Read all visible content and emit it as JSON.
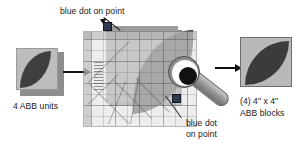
{
  "diagram": {
    "steps": [
      {
        "id": "step-input",
        "label": "4 ABB units"
      },
      {
        "id": "step-cut",
        "label": ""
      },
      {
        "id": "step-output",
        "label_line1": "(4) 4\" x 4\"",
        "label_line2": "ABB blocks"
      }
    ],
    "callouts": [
      {
        "id": "callout-top",
        "text": "blue dot on point"
      },
      {
        "id": "callout-bottom",
        "line1": "blue dot",
        "line2": "on point"
      }
    ],
    "icons": {
      "arrow_left_to_center": "arrow-right-icon",
      "arrow_center_to_right": "arrow-right-icon",
      "cutter": "rotary-cutter-icon",
      "ruler": "quilting-ruler-icon",
      "dot": "blue-dot-icon",
      "leaf": "leaf-patch-icon"
    },
    "colors": {
      "blue_dot": "#2f3a4d",
      "leaf_fabric": "#3f3f3f",
      "background_fabric": "#bdbdbd",
      "ruler_acrylic": "#e2e2e2",
      "text": "#1a1a1a",
      "arrow": "#111111"
    }
  }
}
